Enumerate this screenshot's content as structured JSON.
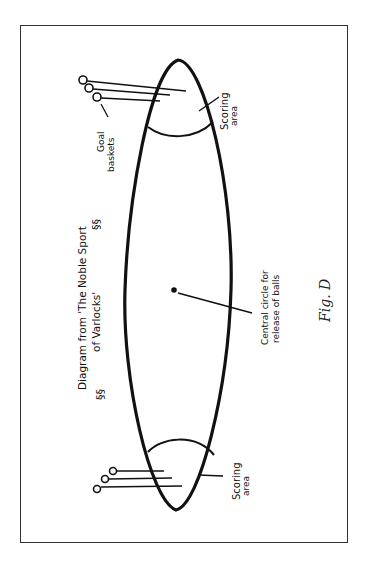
{
  "figure": {
    "caption": "Fig. D",
    "title_line1": "Diagram from 'The Noble Sport",
    "title_line2": "of Varlocks'",
    "labels": {
      "goal_baskets": [
        "Goal",
        "baskets"
      ],
      "scoring_area_top": [
        "Scoring",
        "area"
      ],
      "scoring_area_bottom": [
        "Scoring",
        "area"
      ],
      "central_circle": [
        "Central circle for",
        "release of balls"
      ]
    },
    "colors": {
      "ink": "#111111",
      "frame": "#333333",
      "background": "#ffffff"
    }
  }
}
